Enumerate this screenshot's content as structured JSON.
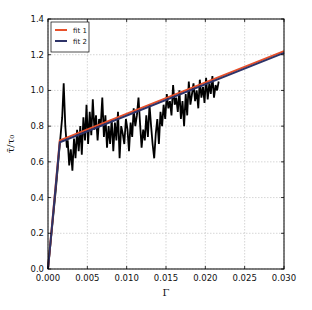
{
  "chart_data": {
    "type": "line",
    "title": "",
    "xlabel": "Γ",
    "ylabel": "τ̄/τ₀",
    "xlim": [
      0.0,
      0.03
    ],
    "ylim": [
      0.0,
      1.4
    ],
    "grid": true,
    "legend_position": "upper left",
    "x_ticks": [
      "0.000",
      "0.005",
      "0.010",
      "0.015",
      "0.020",
      "0.025",
      "0.030"
    ],
    "y_ticks": [
      "0.0",
      "0.2",
      "0.4",
      "0.6",
      "0.8",
      "1.0",
      "1.2",
      "1.4"
    ],
    "series": [
      {
        "name": "data",
        "color": "#000000",
        "in_legend": false,
        "x": [
          0.0,
          0.001,
          0.0018,
          0.002,
          0.0022,
          0.0024,
          0.0025,
          0.0027,
          0.0029,
          0.0031,
          0.0033,
          0.0035,
          0.0037,
          0.0039,
          0.0041,
          0.0043,
          0.0045,
          0.0047,
          0.0049,
          0.0051,
          0.0053,
          0.0055,
          0.0057,
          0.0059,
          0.0061,
          0.0063,
          0.0065,
          0.0067,
          0.0069,
          0.0071,
          0.0073,
          0.0075,
          0.0077,
          0.0079,
          0.0081,
          0.0083,
          0.0085,
          0.0087,
          0.0089,
          0.0091,
          0.0093,
          0.0095,
          0.0097,
          0.0099,
          0.0101,
          0.0103,
          0.0105,
          0.0107,
          0.0109,
          0.0111,
          0.0113,
          0.0115,
          0.0117,
          0.0119,
          0.0121,
          0.0123,
          0.0125,
          0.0127,
          0.0129,
          0.0131,
          0.0133,
          0.0135,
          0.0137,
          0.0139,
          0.0141,
          0.0143,
          0.0145,
          0.0147,
          0.0149,
          0.0151,
          0.0153,
          0.0155,
          0.0157,
          0.0159,
          0.0161,
          0.0163,
          0.0165,
          0.0167,
          0.0169,
          0.0171,
          0.0173,
          0.0175,
          0.0177,
          0.0179,
          0.0181,
          0.0183,
          0.0185,
          0.0187,
          0.0189,
          0.0191,
          0.0193,
          0.0195,
          0.0197,
          0.0199,
          0.0201,
          0.0203,
          0.0205,
          0.0207,
          0.0209,
          0.0211,
          0.0213,
          0.0215,
          0.0217
        ],
        "y": [
          0.0,
          0.45,
          0.85,
          1.04,
          0.8,
          0.68,
          0.72,
          0.58,
          0.67,
          0.55,
          0.73,
          0.62,
          0.78,
          0.66,
          0.8,
          0.64,
          0.85,
          0.72,
          0.92,
          0.7,
          0.88,
          0.75,
          0.95,
          0.78,
          0.86,
          0.72,
          0.84,
          0.8,
          0.96,
          0.74,
          0.86,
          0.68,
          0.8,
          0.7,
          0.84,
          0.66,
          0.82,
          0.72,
          0.88,
          0.62,
          0.8,
          0.76,
          0.7,
          0.84,
          0.78,
          0.66,
          0.82,
          0.74,
          0.9,
          0.8,
          0.86,
          0.96,
          0.82,
          0.68,
          0.78,
          0.72,
          0.86,
          0.74,
          0.92,
          0.8,
          0.7,
          0.62,
          0.76,
          0.84,
          0.7,
          0.88,
          0.8,
          0.92,
          0.84,
          0.98,
          0.9,
          0.94,
          0.86,
          1.03,
          0.92,
          0.96,
          0.88,
          1.0,
          0.84,
          0.94,
          0.8,
          0.98,
          0.86,
          1.05,
          0.92,
          0.98,
          1.04,
          0.94,
          1.0,
          0.9,
          1.06,
          0.96,
          1.02,
          0.93,
          1.07,
          0.95,
          1.04,
          0.98,
          1.08,
          0.96,
          1.03,
          1.0,
          1.05
        ]
      },
      {
        "name": "fit 1",
        "color": "#e8502a",
        "in_legend": true,
        "x": [
          0.0,
          0.0015,
          0.03
        ],
        "y": [
          0.0,
          0.72,
          1.22
        ]
      },
      {
        "name": "fit 2",
        "color": "#2e3368",
        "in_legend": true,
        "x": [
          0.0,
          0.0015,
          0.03
        ],
        "y": [
          0.0,
          0.71,
          1.21
        ]
      }
    ]
  }
}
